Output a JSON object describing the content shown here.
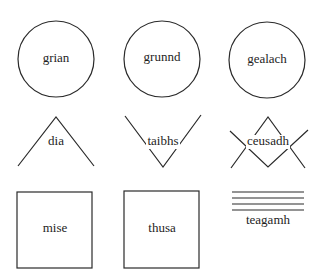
{
  "diagram": {
    "symbols": [
      {
        "word": "grian",
        "symbol": "circle"
      },
      {
        "word": "grunnd",
        "symbol": "circle"
      },
      {
        "word": "gealach",
        "symbol": "circle"
      },
      {
        "word": "dia",
        "symbol": "inverted-v"
      },
      {
        "word": "taibhs",
        "symbol": "v"
      },
      {
        "word": "ceusadh",
        "symbol": "crossed-v-and-inverted-v"
      },
      {
        "word": "mise",
        "symbol": "square"
      },
      {
        "word": "thusa",
        "symbol": "square"
      },
      {
        "word": "teagamh",
        "symbol": "four-horizontal-lines"
      }
    ]
  }
}
